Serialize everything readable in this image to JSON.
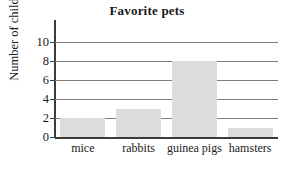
{
  "chart_data": {
    "type": "bar",
    "title": "Favorite pets",
    "xlabel": "",
    "ylabel": "Number of children",
    "categories": [
      "mice",
      "rabbits",
      "guinea pigs",
      "hamsters"
    ],
    "values": [
      2,
      3,
      8,
      1
    ],
    "ylim": [
      0,
      10
    ],
    "ytick_labels": [
      "0",
      "2",
      "4",
      "6",
      "8",
      "10"
    ],
    "ytick_values": [
      0,
      2,
      4,
      6,
      8,
      10
    ],
    "grid": true,
    "legend": false,
    "bar_color": "#dcdcdc",
    "axis_color": "#3b3b3b",
    "gridline_color": "#7d7d7d"
  }
}
